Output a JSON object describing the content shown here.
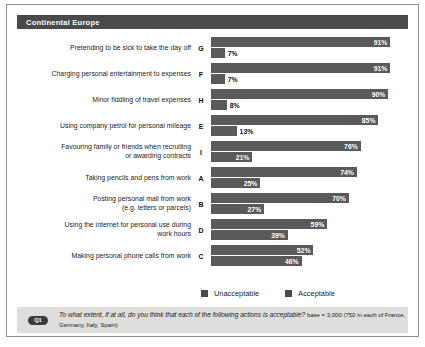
{
  "header": {
    "title": "Continental Europe"
  },
  "legend": {
    "items": [
      {
        "label": "Unacceptable",
        "color": "#4a4a4a"
      },
      {
        "label": "Acceptable",
        "color": "#4a4a4a"
      }
    ]
  },
  "footnote": {
    "badge": "Q1",
    "question": "To what extent, if at all, do you think that each of the following actions is acceptable?",
    "base": "base = 3,000 (750 in each of France, Germany, Italy, Spain)"
  },
  "chart_data": {
    "type": "bar",
    "title": "Continental Europe",
    "orientation": "horizontal",
    "xlabel": "",
    "ylabel": "",
    "xlim": [
      0,
      100
    ],
    "grid": false,
    "legend_position": "bottom",
    "categories": [
      "Pretending to be sick to take the day off",
      "Charging personal entertainment to expenses",
      "Minor fiddling of travel expenses",
      "Using company petrol for personal mileage",
      "Favouring family or friends when recruiting or awarding contracts",
      "Taking pencils and pens from work",
      "Posting personal mail from work (e.g. letters or parcels)",
      "Using the internet for personal use during work hours",
      "Making personal phone calls from work"
    ],
    "category_lines": [
      [
        "Pretending to be sick to take the day off"
      ],
      [
        "Charging personal entertainment to expenses"
      ],
      [
        "Minor fiddling of travel expenses"
      ],
      [
        "Using company petrol for personal mileage"
      ],
      [
        "Favouring family or friends when recruiting",
        "or awarding contracts"
      ],
      [
        "Taking pencils and pens from work"
      ],
      [
        "Posting personal mail from work",
        "(e.g. letters or parcels)"
      ],
      [
        "Using the internet for personal use during",
        "work hours"
      ],
      [
        "Making personal phone calls from work"
      ]
    ],
    "codes": [
      "G",
      "F",
      "H",
      "E",
      "I",
      "A",
      "B",
      "D",
      "C"
    ],
    "series": [
      {
        "name": "Unacceptable",
        "values": [
          91,
          91,
          90,
          85,
          76,
          74,
          70,
          59,
          52
        ],
        "labels": [
          "91%",
          "91%",
          "90%",
          "85%",
          "76%",
          "74%",
          "70%",
          "59%",
          "52%"
        ]
      },
      {
        "name": "Acceptable",
        "values": [
          7,
          7,
          8,
          13,
          21,
          25,
          27,
          39,
          46
        ],
        "labels": [
          "7%",
          "7%",
          "8%",
          "13%",
          "21%",
          "25%",
          "27%",
          "39%",
          "46%"
        ]
      }
    ]
  }
}
